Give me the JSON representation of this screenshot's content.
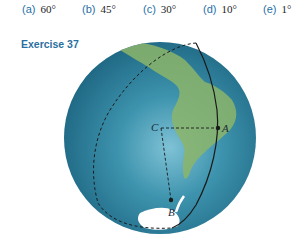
{
  "choices": [
    {
      "label": "(a)",
      "value": "60°"
    },
    {
      "label": "(b)",
      "value": "45°"
    },
    {
      "label": "(c)",
      "value": "30°"
    },
    {
      "label": "(d)",
      "value": "10°"
    },
    {
      "label": "(e)",
      "value": "1°"
    }
  ],
  "exercise_title": "Exercise 37",
  "figure": {
    "points": {
      "A": "A",
      "B": "B",
      "C": "C"
    },
    "colors": {
      "ocean": "#2b7f9a",
      "land": "#8cb56a",
      "ice": "#ffffff",
      "lines": "#1a1a1a"
    }
  }
}
